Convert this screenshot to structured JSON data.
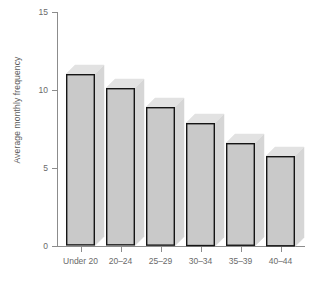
{
  "chart_data": {
    "type": "bar",
    "title": "",
    "xlabel": "",
    "ylabel": "Average monthly frequency",
    "categories": [
      "Under 20",
      "20–24",
      "25–29",
      "30–34",
      "35–39",
      "40–44"
    ],
    "values": [
      11.0,
      10.1,
      8.9,
      7.9,
      6.6,
      5.8
    ],
    "ylim": [
      0,
      15
    ],
    "yticks": [
      0,
      5,
      10,
      15
    ],
    "ytick_labels": [
      "0",
      "5",
      "10",
      "15"
    ],
    "grid": false,
    "legend": null,
    "style": "3d-bar",
    "colors": {
      "bar_front": "#c9c9c9",
      "bar_top": "#e2e2e2",
      "bar_side": "#d6d6d6",
      "bar_outline": "#151515",
      "axis": "#8c8c8c",
      "text": "#6a6a6a",
      "background": "#ffffff"
    }
  }
}
